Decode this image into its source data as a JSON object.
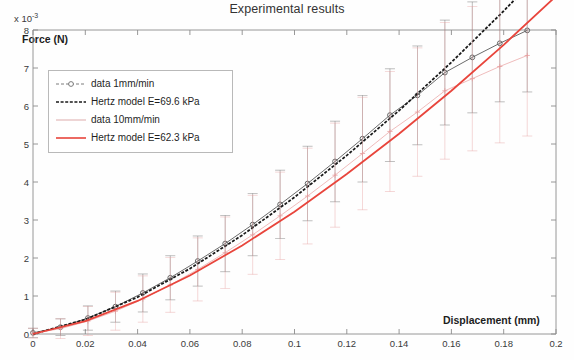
{
  "chart_data": {
    "type": "line",
    "title": "Experimental results",
    "xlabel": "Displacement (mm)",
    "ylabel": "Force (N)",
    "y_multiplier": "x 10",
    "y_multiplier_exp": "-3",
    "xlim": [
      0,
      0.2
    ],
    "ylim": [
      0,
      0.008
    ],
    "grid": false,
    "legend_position": "upper left",
    "xticks": [
      0,
      0.02,
      0.04,
      0.06,
      0.08,
      0.1,
      0.12,
      0.14,
      0.16,
      0.18,
      0.2
    ],
    "xtick_labels": [
      "0",
      "0.02",
      "0.04",
      "0.06",
      "0.08",
      "0.1",
      "0.12",
      "0.14",
      "0.16",
      "0.18",
      "0.2"
    ],
    "yticks": [
      0,
      0.001,
      0.002,
      0.003,
      0.004,
      0.005,
      0.006,
      0.007,
      0.008
    ],
    "ytick_labels": [
      "0",
      "1",
      "2",
      "3",
      "4",
      "5",
      "6",
      "7",
      "8"
    ],
    "legend": [
      {
        "label": "data 1mm/min",
        "color": "#6e6e6e",
        "style": "dashed-marker",
        "marker": "circle"
      },
      {
        "label": "Hertz model E=69.6 kPa",
        "color": "#1a1a1a",
        "style": "dashed",
        "marker": "none"
      },
      {
        "label": "data 10mm/min",
        "color": "#d9a0a0",
        "style": "solid-faint",
        "marker": "none"
      },
      {
        "label": "Hertz model E=62.3 kPa",
        "color": "#e8453c",
        "style": "solid",
        "marker": "none"
      }
    ],
    "series": [
      {
        "name": "data 1mm/min",
        "color": "#5a5a5a",
        "marker": "circle",
        "x": [
          0.0,
          0.0105,
          0.021,
          0.0315,
          0.042,
          0.0525,
          0.063,
          0.0735,
          0.084,
          0.0945,
          0.105,
          0.1155,
          0.126,
          0.1365,
          0.147,
          0.1575,
          0.168,
          0.1785,
          0.189
        ],
        "y": [
          3e-05,
          0.00018,
          0.00042,
          0.00072,
          0.00108,
          0.00148,
          0.00192,
          0.00238,
          0.00288,
          0.00341,
          0.00396,
          0.00454,
          0.00514,
          0.00576,
          0.00628,
          0.00688,
          0.00728,
          0.00765,
          0.00799
        ],
        "yerr": [
          0.00012,
          0.00022,
          0.00032,
          0.00041,
          0.0005,
          0.00058,
          0.00066,
          0.00074,
          0.00082,
          0.0009,
          0.00098,
          0.00106,
          0.00114,
          0.00122,
          0.0013,
          0.00138,
          0.00146,
          0.00154,
          0.00162
        ]
      },
      {
        "name": "Hertz model E=69.6 kPa",
        "color": "#1a1a1a",
        "marker": "none",
        "E_kPa": 69.6,
        "x": [
          0.0,
          0.02,
          0.04,
          0.06,
          0.08,
          0.1,
          0.12,
          0.14,
          0.16,
          0.18,
          0.2
        ],
        "y": [
          0.0,
          0.00038,
          0.00097,
          0.00172,
          0.0026,
          0.0036,
          0.0047,
          0.00588,
          0.00715,
          0.0085,
          0.00993
        ]
      },
      {
        "name": "data 10mm/min",
        "color": "#e79b9b",
        "marker": "cross",
        "x": [
          0.0,
          0.0105,
          0.021,
          0.0315,
          0.042,
          0.0525,
          0.063,
          0.0735,
          0.084,
          0.0945,
          0.105,
          0.1155,
          0.126,
          0.1365,
          0.147,
          0.1575,
          0.168,
          0.1785,
          0.189
        ],
        "y": [
          2e-05,
          0.00014,
          0.00034,
          0.0006,
          0.00092,
          0.00129,
          0.0017,
          0.00214,
          0.00261,
          0.00311,
          0.00363,
          0.00418,
          0.00475,
          0.00533,
          0.00584,
          0.0064,
          0.00672,
          0.00704,
          0.00733
        ],
        "yerr": [
          0.00013,
          0.00026,
          0.00038,
          0.0005,
          0.00061,
          0.00072,
          0.00083,
          0.00094,
          0.00104,
          0.00115,
          0.00126,
          0.00137,
          0.00148,
          0.00158,
          0.00169,
          0.0018,
          0.0019,
          0.00201,
          0.00212
        ]
      },
      {
        "name": "Hertz model E=62.3 kPa",
        "color": "#e8453c",
        "marker": "none",
        "E_kPa": 62.3,
        "x": [
          0.0,
          0.02,
          0.04,
          0.06,
          0.08,
          0.1,
          0.12,
          0.14,
          0.16,
          0.18,
          0.2
        ],
        "y": [
          0.0,
          0.00034,
          0.00087,
          0.00154,
          0.00233,
          0.00322,
          0.00421,
          0.00527,
          0.0064,
          0.00761,
          0.00889
        ]
      }
    ]
  }
}
